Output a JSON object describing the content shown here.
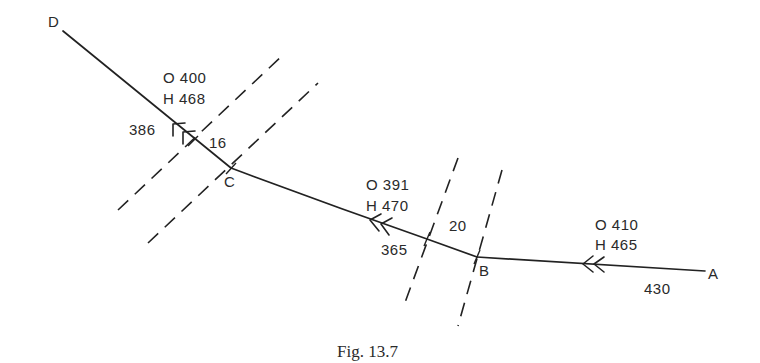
{
  "figure": {
    "caption": "Fig. 13.7",
    "points": {
      "A": "A",
      "B": "B",
      "C": "C",
      "D": "D"
    },
    "legs": [
      {
        "from": "A",
        "to": "B",
        "course_O": "O 410",
        "heading_H": "H 465",
        "distance": "430"
      },
      {
        "from": "B",
        "to": "C",
        "course_O": "O 391",
        "heading_H": "H 470",
        "distance": "365"
      },
      {
        "from": "C",
        "to": "D",
        "course_O": "O 400",
        "heading_H": "H 468",
        "distance": "386"
      }
    ],
    "zones": [
      {
        "between": "B",
        "width_label": "20"
      },
      {
        "between": "C",
        "width_label": "16"
      }
    ],
    "colors": {
      "ink": "#222222",
      "background": "#ffffff"
    }
  }
}
